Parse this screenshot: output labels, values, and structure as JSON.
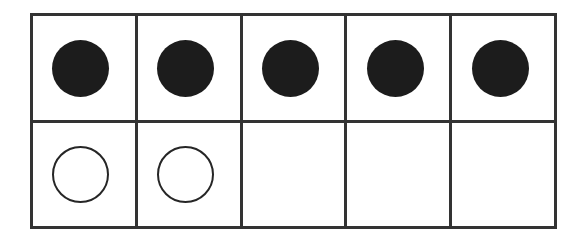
{
  "figure": {
    "kind": "counter-grid",
    "rows": 2,
    "columns": 5,
    "colors": {
      "background": "#ffffff",
      "grid_line": "#333333",
      "filled_counter": "#1c1c1c",
      "open_counter_outline": "#262626"
    },
    "counter_shape": "circle",
    "counter_diameter_px": 57,
    "grid_line_width_px": 3
  },
  "grid": {
    "rows": [
      {
        "row_label": "top-row",
        "cells": [
          {
            "cell_label": "r1c1",
            "counter": "filled",
            "counter_name": "filled-counter"
          },
          {
            "cell_label": "r1c2",
            "counter": "filled",
            "counter_name": "filled-counter"
          },
          {
            "cell_label": "r1c3",
            "counter": "filled",
            "counter_name": "filled-counter"
          },
          {
            "cell_label": "r1c4",
            "counter": "filled",
            "counter_name": "filled-counter"
          },
          {
            "cell_label": "r1c5",
            "counter": "filled",
            "counter_name": "filled-counter"
          }
        ]
      },
      {
        "row_label": "bottom-row",
        "cells": [
          {
            "cell_label": "r2c1",
            "counter": "open",
            "counter_name": "open-counter"
          },
          {
            "cell_label": "r2c2",
            "counter": "open",
            "counter_name": "open-counter"
          },
          {
            "cell_label": "r2c3",
            "counter": "empty",
            "counter_name": "empty-cell"
          },
          {
            "cell_label": "r2c4",
            "counter": "empty",
            "counter_name": "empty-cell"
          },
          {
            "cell_label": "r2c5",
            "counter": "empty",
            "counter_name": "empty-cell"
          }
        ]
      }
    ],
    "counts": {
      "filled_total": 5,
      "open_total": 2,
      "empty_total": 3
    }
  }
}
